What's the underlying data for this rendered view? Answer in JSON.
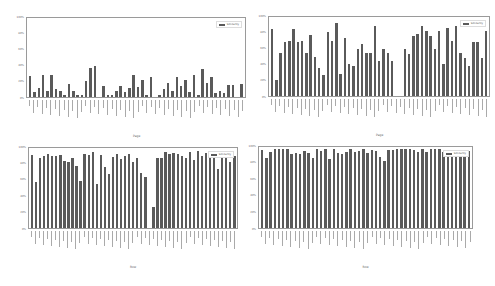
{
  "chart_data": [
    {
      "type": "bar",
      "position": "top-left",
      "title": "",
      "xlabel": "Page",
      "ylabel": "",
      "ylim": [
        0,
        100
      ],
      "yticks": [
        "0%",
        "20%",
        "40%",
        "60%",
        "80%",
        "100%"
      ],
      "legend": [
        "Similarity"
      ],
      "legend_position": "upper right",
      "series": [
        {
          "name": "Similarity",
          "values": [
            26,
            6,
            11,
            28,
            8,
            28,
            10,
            8,
            3,
            16,
            8,
            3,
            3,
            20,
            37,
            39,
            0,
            14,
            3,
            3,
            8,
            14,
            6,
            12,
            28,
            13,
            21,
            3,
            25,
            0,
            2,
            10,
            18,
            8,
            25,
            14,
            21,
            6,
            28,
            2,
            36,
            18,
            25,
            5,
            7,
            5,
            15,
            15,
            0,
            16
          ]
        }
      ]
    },
    {
      "type": "bar",
      "position": "top-right",
      "title": "",
      "xlabel": "Page",
      "ylabel": "",
      "ylim": [
        0,
        100
      ],
      "yticks": [
        "0%",
        "20%",
        "40%",
        "60%",
        "80%",
        "100%"
      ],
      "legend": [
        "Similarity"
      ],
      "legend_position": "upper right",
      "series": [
        {
          "name": "Similarity",
          "values": [
            85,
            20,
            55,
            68,
            70,
            85,
            69,
            70,
            54,
            77,
            50,
            36,
            26,
            81,
            70,
            93,
            28,
            74,
            40,
            38,
            59,
            66,
            54,
            54,
            88,
            44,
            59,
            55,
            44,
            0,
            0,
            59,
            53,
            76,
            78,
            88,
            82,
            76,
            60,
            82,
            41,
            86,
            70,
            88,
            54,
            48,
            38,
            69,
            68,
            48,
            82
          ]
        }
      ]
    },
    {
      "type": "bar",
      "position": "bottom-left",
      "title": "",
      "xlabel": "Row",
      "ylabel": "",
      "ylim": [
        0,
        100
      ],
      "yticks": [
        "0%",
        "20%",
        "40%",
        "60%",
        "80%",
        "100%"
      ],
      "legend": [
        "Similarity"
      ],
      "legend_position": "upper right",
      "series": [
        {
          "name": "Similarity",
          "values": [
            91,
            57,
            87,
            90,
            92,
            90,
            90,
            91,
            84,
            83,
            88,
            78,
            59,
            92,
            91,
            95,
            55,
            91,
            76,
            67,
            89,
            92,
            86,
            90,
            93,
            83,
            87,
            69,
            64,
            0,
            26,
            87,
            88,
            95,
            92,
            94,
            93,
            90,
            87,
            95,
            85,
            96,
            90,
            94,
            87,
            91,
            74,
            91,
            91,
            82,
            90
          ]
        }
      ]
    },
    {
      "type": "bar",
      "position": "bottom-right",
      "title": "",
      "xlabel": "Row",
      "ylabel": "",
      "ylim": [
        0,
        100
      ],
      "yticks": [
        "0%",
        "20%",
        "40%",
        "60%",
        "80%",
        "100%"
      ],
      "legend": [
        "Similarity"
      ],
      "legend_position": "upper right",
      "series": [
        {
          "name": "Similarity",
          "values": [
            96,
            87,
            94,
            97,
            97,
            97,
            97,
            91,
            93,
            91,
            95,
            92,
            87,
            97,
            95,
            98,
            85,
            97,
            92,
            91,
            94,
            98,
            94,
            95,
            97,
            92,
            96,
            95,
            88,
            83,
            96,
            96,
            97,
            97,
            98,
            97,
            96,
            94,
            97,
            94,
            98,
            97,
            98,
            94,
            96,
            96,
            95,
            95,
            88,
            95
          ]
        }
      ]
    }
  ],
  "colors": {
    "bar": "#5a5a5a",
    "axis": "#9a9a9a",
    "background": "#ffffff"
  }
}
